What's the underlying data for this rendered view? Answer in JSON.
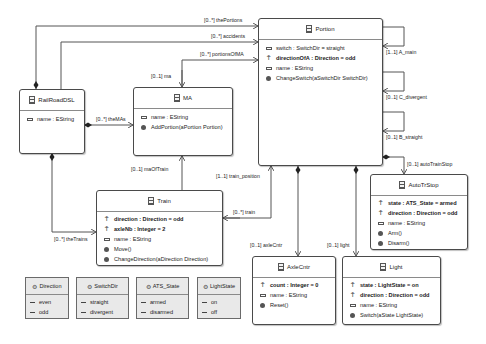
{
  "classes": {
    "portion": {
      "name": "Portion",
      "attrs": [
        {
          "text": "switch : SwitchDir = straight",
          "kind": "attribute",
          "bold": false
        },
        {
          "text": "directionOfA : Direction = odd",
          "kind": "pinned-attribute",
          "bold": true
        },
        {
          "text": "name : EString",
          "kind": "attribute",
          "bold": false
        }
      ],
      "ops": [
        "ChangeSwitch(aSwitchDir SwitchDir)"
      ]
    },
    "railroad": {
      "name": "RailRoadDSL",
      "attrs": [
        {
          "text": "name : EString"
        }
      ]
    },
    "ma": {
      "name": "MA",
      "attrs": [
        {
          "text": "name : EString"
        }
      ],
      "ops": [
        "AddPortion(aPortion Portion)"
      ]
    },
    "train": {
      "name": "Train",
      "attrs": [
        {
          "text": "direction : Direction = odd"
        },
        {
          "text": "axleNb : Integer = 2"
        },
        {
          "text": "name : EString"
        }
      ],
      "ops": [
        "Move()",
        "ChangeDirection(aDirection Direction)"
      ]
    },
    "autotrstop": {
      "name": "AutoTrStop",
      "attrs": [
        {
          "text": "state : ATS_State = armed"
        },
        {
          "text": "direction : Direction = odd"
        },
        {
          "text": "name : EString"
        }
      ],
      "ops": [
        "Arm()",
        "Disarm()"
      ]
    },
    "axlecntr": {
      "name": "AxleCntr",
      "attrs": [
        {
          "text": "count : Integer = 0"
        },
        {
          "text": "name : EString"
        }
      ],
      "ops": [
        "Reset()"
      ]
    },
    "light": {
      "name": "Light",
      "attrs": [
        {
          "text": "state : LightState = on"
        },
        {
          "text": "direction : Direction = odd"
        },
        {
          "text": "name : EString"
        }
      ],
      "ops": [
        "Switch(aState LightState)"
      ]
    }
  },
  "enums": [
    {
      "name": "Direction",
      "literals": [
        "even",
        "odd"
      ]
    },
    {
      "name": "SwitchDir",
      "literals": [
        "straight",
        "divergent"
      ]
    },
    {
      "name": "ATS_State",
      "literals": [
        "armed",
        "disarmed"
      ]
    },
    {
      "name": "LightState",
      "literals": [
        "on",
        "off"
      ]
    }
  ],
  "references": {
    "thePortions": "[0..*] thePortions",
    "accidents": "[0..*] accidents",
    "portionsOfMA": "[0..*] portionsOfMA",
    "ma": "[0..1] ma",
    "theMAs": "[0..*] theMAs",
    "maOfTrain": "[0..1] maOfTrain",
    "trainPosition": "[1..1] train_position",
    "train": "[0..*] train",
    "theTrains": "[0..*] theTrains",
    "aMain": "[1..1] A_main",
    "cDivergent": "[0..1] C_divergent",
    "bStraight": "[0..1] B_straight",
    "autoTrainStop": "[0..1] autoTrainStop",
    "axleCntr": "[0..1] axleCntr",
    "light": "[0..1] light"
  },
  "colors": {
    "line": "#555555",
    "border": "#4a4a4a",
    "enum_bg": "#e9e9e9"
  }
}
